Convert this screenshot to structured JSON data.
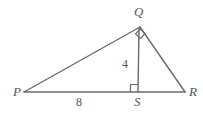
{
  "figure": {
    "kind": "geometry-diagram",
    "background_color": "#ffffff",
    "stroke_color": "#6b6b6b",
    "label_color": "#555555",
    "vertices": {
      "P": {
        "label": "P",
        "x": 24,
        "y": 92
      },
      "Q": {
        "label": "Q",
        "x": 140,
        "y": 27
      },
      "R": {
        "label": "R",
        "x": 185,
        "y": 92
      },
      "S": {
        "label": "S",
        "x": 138,
        "y": 92
      }
    },
    "segments": [
      {
        "name": "PQ",
        "from": "P",
        "to": "Q"
      },
      {
        "name": "QR",
        "from": "Q",
        "to": "R"
      },
      {
        "name": "PR",
        "from": "P",
        "to": "R"
      },
      {
        "name": "QS",
        "from": "Q",
        "to": "S"
      }
    ],
    "measures": {
      "altitude": "4",
      "base_segment": "8"
    },
    "right_angles": [
      {
        "name": "angle-PQR",
        "at": "Q"
      },
      {
        "name": "angle-QSP",
        "at": "S"
      }
    ]
  }
}
